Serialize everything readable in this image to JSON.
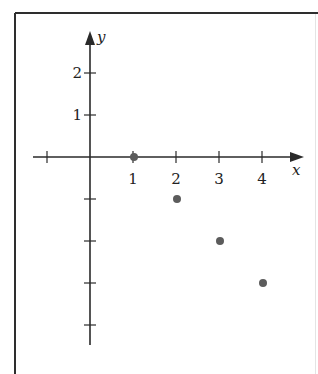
{
  "chart_data": {
    "type": "scatter",
    "title": "",
    "xlabel": "x",
    "ylabel": "y",
    "x_ticks": [
      -1,
      1,
      2,
      3,
      4
    ],
    "x_tick_labels": [
      "",
      "1",
      "2",
      "3",
      "4"
    ],
    "y_ticks": [
      2,
      1,
      -1,
      -2,
      -3,
      -4
    ],
    "y_tick_labels": [
      "2",
      "1",
      "",
      "",
      "",
      ""
    ],
    "xlim": [
      -1.7,
      5.0
    ],
    "ylim": [
      -4.5,
      3.0
    ],
    "grid": false,
    "legend": null,
    "series": [
      {
        "name": "points",
        "x": [
          1,
          2,
          3,
          4
        ],
        "y": [
          0,
          -1,
          -2,
          -3
        ]
      }
    ],
    "colors": {
      "axis": "#2a2a2a",
      "point": "#5c5c5c",
      "frame": "#2e2e2e"
    }
  }
}
